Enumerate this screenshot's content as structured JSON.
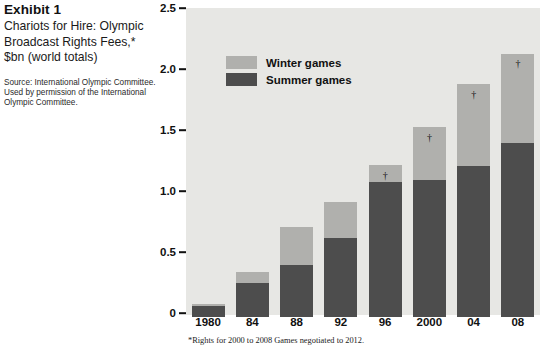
{
  "caption": {
    "exhibit_label": "Exhibit 1",
    "title": "Chariots for Hire: Olympic Broadcast Rights Fees,* $bn (world totals)",
    "source": "Source: International Olympic Committee. Used by permission of the International Olympic Committee."
  },
  "footnote": "*Rights for 2000 to 2008 Games negotiated to 2012.",
  "colors": {
    "winter": "#b0b0ad",
    "summer": "#4d4d4d",
    "panel": "#e7e7e4",
    "text": "#111111"
  },
  "chart_data": {
    "type": "bar",
    "subtype": "stacked",
    "title": "Chariots for Hire: Olympic Broadcast Rights Fees,* $bn (world totals)",
    "xlabel": "",
    "ylabel": "$bn (world totals)",
    "ylim": [
      0,
      2.5
    ],
    "yticks": [
      0,
      0.5,
      1.0,
      1.5,
      2.0,
      2.5
    ],
    "ytick_labels": [
      "0",
      "0.5",
      "1.0",
      "1.5",
      "2.0",
      "2.5"
    ],
    "grid": false,
    "legend_position": "upper-left-inside",
    "categories": [
      "1980",
      "84",
      "88",
      "92",
      "96",
      "2000",
      "04",
      "08"
    ],
    "series": [
      {
        "name": "Summer games",
        "color": "#4d4d4d",
        "values": [
          0.09,
          0.28,
          0.43,
          0.65,
          1.11,
          1.12,
          1.24,
          1.43
        ]
      },
      {
        "name": "Winter games",
        "color": "#b0b0ad",
        "values": [
          0.02,
          0.09,
          0.31,
          0.29,
          0.14,
          0.44,
          0.67,
          0.73
        ]
      }
    ],
    "totals": [
      0.11,
      0.37,
      0.74,
      0.94,
      1.25,
      1.56,
      1.91,
      2.16
    ],
    "annotations": [
      {
        "category": "96",
        "symbol": "†"
      },
      {
        "category": "2000",
        "symbol": "†"
      },
      {
        "category": "04",
        "symbol": "†"
      },
      {
        "category": "08",
        "symbol": "†"
      }
    ],
    "annotation_symbol": "†",
    "legend": [
      "Winter games",
      "Summer games"
    ]
  }
}
